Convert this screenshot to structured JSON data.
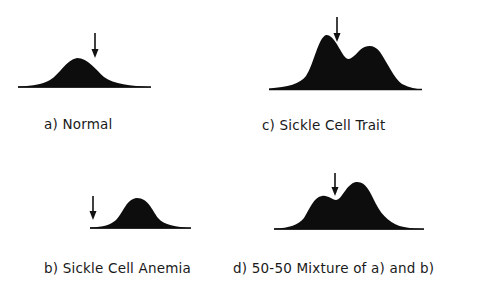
{
  "panels": [
    {
      "id": "a",
      "label": "a) Normal",
      "shape": "single-peak",
      "arrow_position": "right of peak"
    },
    {
      "id": "b",
      "label": "b) Sickle Cell Anemia",
      "shape": "single-peak, shifted right",
      "arrow_position": "left of curve"
    },
    {
      "id": "c",
      "label": "c) Sickle Cell Trait",
      "shape": "double-peak, left peak higher",
      "arrow_position": "right of left peak"
    },
    {
      "id": "d",
      "label": "d) 50-50 Mixture of a) and b)",
      "shape": "double-peak, right peak higher",
      "arrow_position": "between peaks"
    }
  ],
  "colors": {
    "fill": "#0d0d0d",
    "background": "#ffffff",
    "text": "#1a1a1a"
  }
}
